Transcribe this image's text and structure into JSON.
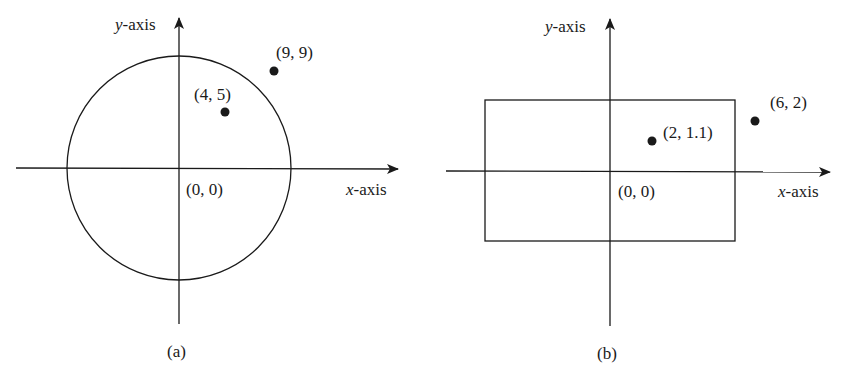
{
  "panels": [
    {
      "caption": "(a)",
      "shape": "circle",
      "x_axis_var": "x",
      "x_axis_suffix": "-axis",
      "y_axis_var": "y",
      "y_axis_suffix": "-axis",
      "origin_label": "(0, 0)",
      "points": [
        {
          "label": "(4, 5)",
          "x": 4,
          "y": 5
        },
        {
          "label": "(9, 9)",
          "x": 9,
          "y": 9
        }
      ]
    },
    {
      "caption": "(b)",
      "shape": "rectangle",
      "x_axis_var": "x",
      "x_axis_suffix": "-axis",
      "y_axis_var": "y",
      "y_axis_suffix": "-axis",
      "origin_label": "(0, 0)",
      "points": [
        {
          "label": "(2, 1.1)",
          "x": 2,
          "y": 1.1
        },
        {
          "label": "(6, 2)",
          "x": 6,
          "y": 2
        }
      ]
    }
  ],
  "colors": {
    "ink": "#1a1a1a",
    "background": "#ffffff"
  }
}
